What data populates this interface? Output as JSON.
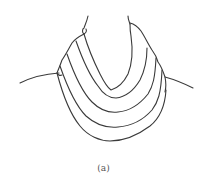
{
  "figure": {
    "caption": "(a)",
    "line_color": "#3a3a3a",
    "fold_count": 4
  }
}
